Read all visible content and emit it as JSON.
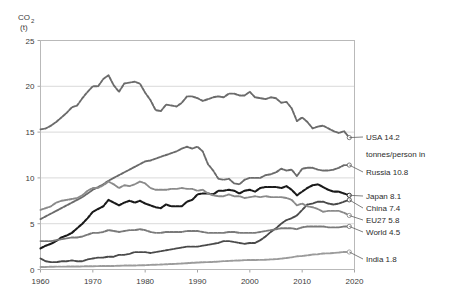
{
  "axis": {
    "y_title_line1": "CO",
    "y_title_sub": "2",
    "y_title_line2": "(t)",
    "y_ticks": [
      0,
      5,
      10,
      15,
      20,
      25
    ],
    "x_ticks": [
      1960,
      1970,
      1980,
      1990,
      2000,
      2010,
      2020
    ],
    "ylim": [
      0,
      25
    ],
    "xlim": [
      1960,
      2020
    ]
  },
  "legend": {
    "entries": [
      {
        "label": "USA 14.2",
        "color": "#6b6b6b"
      },
      {
        "label": "tonnes/person in",
        "color": "none"
      },
      {
        "label": "Russia 10.8",
        "color": "#6b6b6b"
      },
      {
        "label": "Japan 8.1",
        "color": "#1a1a1a"
      },
      {
        "label": "China 7.4",
        "color": "#4a4a4a"
      },
      {
        "label": "EU27 5.8",
        "color": "#8a8a8a"
      },
      {
        "label": "World 4.5",
        "color": "#7a7a7a"
      },
      {
        "label": "India 1.8",
        "color": "#9b9b9b"
      }
    ]
  },
  "chart_data": {
    "type": "line",
    "title": "",
    "xlabel": "",
    "ylabel": "CO2 (t)",
    "xlim": [
      1960,
      2020
    ],
    "ylim": [
      0,
      25
    ],
    "grid": true,
    "legend_position": "right",
    "x": [
      1960,
      1961,
      1962,
      1963,
      1964,
      1965,
      1966,
      1967,
      1968,
      1969,
      1970,
      1971,
      1972,
      1973,
      1974,
      1975,
      1976,
      1977,
      1978,
      1979,
      1980,
      1981,
      1982,
      1983,
      1984,
      1985,
      1986,
      1987,
      1988,
      1989,
      1990,
      1991,
      1992,
      1993,
      1994,
      1995,
      1996,
      1997,
      1998,
      1999,
      2000,
      2001,
      2002,
      2003,
      2004,
      2005,
      2006,
      2007,
      2008,
      2009,
      2010,
      2011,
      2012,
      2013,
      2014,
      2015,
      2016,
      2017,
      2018,
      2019
    ],
    "series": [
      {
        "name": "USA",
        "color": "#6b6b6b",
        "end_value": 14.2,
        "values": [
          15.3,
          15.4,
          15.7,
          16.1,
          16.6,
          17.1,
          17.7,
          17.9,
          18.7,
          19.4,
          20.0,
          20.0,
          20.8,
          21.2,
          20.1,
          19.4,
          20.3,
          20.4,
          20.5,
          20.3,
          19.3,
          18.5,
          17.4,
          17.3,
          18.0,
          17.9,
          17.8,
          18.2,
          18.9,
          18.9,
          18.7,
          18.4,
          18.6,
          18.8,
          18.9,
          18.8,
          19.2,
          19.2,
          19.0,
          19.0,
          19.4,
          18.8,
          18.7,
          18.6,
          18.8,
          18.7,
          18.2,
          18.3,
          17.6,
          16.2,
          16.6,
          16.1,
          15.4,
          15.6,
          15.7,
          15.4,
          15.1,
          14.9,
          15.1,
          14.4
        ]
      },
      {
        "name": "Russia",
        "color": "#6b6b6b",
        "end_value": 10.8,
        "values": [
          5.5,
          5.8,
          6.1,
          6.4,
          6.7,
          7.0,
          7.3,
          7.6,
          7.9,
          8.3,
          8.7,
          9.0,
          9.3,
          9.7,
          10.0,
          10.3,
          10.6,
          10.9,
          11.2,
          11.5,
          11.8,
          11.9,
          12.1,
          12.3,
          12.5,
          12.7,
          12.9,
          13.2,
          13.4,
          13.2,
          13.4,
          12.9,
          11.5,
          10.8,
          9.9,
          9.8,
          9.9,
          9.4,
          9.3,
          9.8,
          10.0,
          10.0,
          10.0,
          10.3,
          10.4,
          10.6,
          11.0,
          10.8,
          10.9,
          10.2,
          11.0,
          11.1,
          11.1,
          10.9,
          10.8,
          10.8,
          10.9,
          11.1,
          11.4,
          11.4
        ]
      },
      {
        "name": "Japan",
        "color": "#1a1a1a",
        "end_value": 8.1,
        "values": [
          2.3,
          2.6,
          2.8,
          3.1,
          3.5,
          3.7,
          4.0,
          4.5,
          5.0,
          5.6,
          6.3,
          6.6,
          6.9,
          7.6,
          7.3,
          7.0,
          7.3,
          7.5,
          7.3,
          7.5,
          7.2,
          7.0,
          6.8,
          6.7,
          7.1,
          6.9,
          6.9,
          6.9,
          7.4,
          7.6,
          8.2,
          8.3,
          8.3,
          8.2,
          8.6,
          8.6,
          8.7,
          8.6,
          8.3,
          8.6,
          8.7,
          8.5,
          8.9,
          9.0,
          9.0,
          9.0,
          8.9,
          9.1,
          8.7,
          8.1,
          8.5,
          8.9,
          9.2,
          9.3,
          9.0,
          8.7,
          8.5,
          8.5,
          8.3,
          8.1
        ]
      },
      {
        "name": "China",
        "color": "#4a4a4a",
        "end_value": 7.4,
        "values": [
          1.2,
          0.9,
          0.8,
          0.8,
          0.9,
          0.9,
          1.0,
          0.9,
          0.9,
          1.1,
          1.2,
          1.3,
          1.3,
          1.4,
          1.4,
          1.6,
          1.6,
          1.7,
          1.9,
          1.9,
          1.9,
          1.8,
          1.9,
          2.0,
          2.1,
          2.2,
          2.3,
          2.4,
          2.5,
          2.5,
          2.5,
          2.6,
          2.7,
          2.8,
          2.9,
          3.1,
          3.1,
          3.0,
          2.9,
          2.8,
          2.9,
          2.9,
          3.2,
          3.6,
          4.1,
          4.5,
          5.0,
          5.4,
          5.6,
          5.9,
          6.5,
          7.1,
          7.2,
          7.4,
          7.4,
          7.2,
          7.1,
          7.2,
          7.4,
          7.6
        ]
      },
      {
        "name": "EU27",
        "color": "#8a8a8a",
        "end_value": 5.8,
        "values": [
          6.5,
          6.7,
          6.9,
          7.3,
          7.5,
          7.6,
          7.7,
          7.8,
          8.1,
          8.6,
          8.9,
          8.9,
          9.2,
          9.6,
          9.3,
          8.9,
          9.2,
          9.1,
          9.3,
          9.6,
          9.4,
          8.9,
          8.7,
          8.7,
          8.7,
          8.8,
          8.8,
          8.9,
          8.8,
          8.8,
          8.6,
          8.7,
          8.3,
          8.1,
          8.0,
          8.0,
          8.2,
          8.0,
          8.0,
          7.8,
          7.9,
          8.0,
          7.9,
          8.0,
          7.9,
          7.9,
          7.9,
          7.8,
          7.6,
          7.0,
          7.2,
          6.9,
          6.8,
          6.6,
          6.3,
          6.4,
          6.4,
          6.4,
          6.2,
          5.9
        ]
      },
      {
        "name": "World",
        "color": "#7a7a7a",
        "end_value": 4.5,
        "values": [
          3.1,
          3.1,
          3.1,
          3.2,
          3.3,
          3.4,
          3.5,
          3.5,
          3.6,
          3.8,
          4.0,
          4.0,
          4.1,
          4.3,
          4.2,
          4.1,
          4.2,
          4.3,
          4.3,
          4.4,
          4.3,
          4.1,
          4.0,
          4.0,
          4.1,
          4.1,
          4.1,
          4.1,
          4.2,
          4.2,
          4.2,
          4.1,
          4.0,
          4.0,
          4.0,
          4.0,
          4.1,
          4.1,
          4.0,
          4.0,
          4.0,
          4.0,
          4.1,
          4.2,
          4.3,
          4.4,
          4.5,
          4.5,
          4.5,
          4.4,
          4.6,
          4.7,
          4.7,
          4.7,
          4.7,
          4.6,
          4.6,
          4.6,
          4.7,
          4.7
        ]
      },
      {
        "name": "India",
        "color": "#9b9b9b",
        "end_value": 1.8,
        "values": [
          0.27,
          0.28,
          0.3,
          0.31,
          0.31,
          0.32,
          0.32,
          0.33,
          0.34,
          0.36,
          0.36,
          0.37,
          0.38,
          0.38,
          0.39,
          0.41,
          0.43,
          0.44,
          0.44,
          0.46,
          0.47,
          0.5,
          0.52,
          0.54,
          0.57,
          0.6,
          0.62,
          0.66,
          0.69,
          0.73,
          0.76,
          0.79,
          0.81,
          0.83,
          0.86,
          0.91,
          0.94,
          0.97,
          0.98,
          1.02,
          1.04,
          1.04,
          1.05,
          1.06,
          1.1,
          1.13,
          1.19,
          1.26,
          1.33,
          1.44,
          1.48,
          1.54,
          1.63,
          1.66,
          1.75,
          1.76,
          1.8,
          1.85,
          1.92,
          1.91
        ]
      }
    ]
  }
}
